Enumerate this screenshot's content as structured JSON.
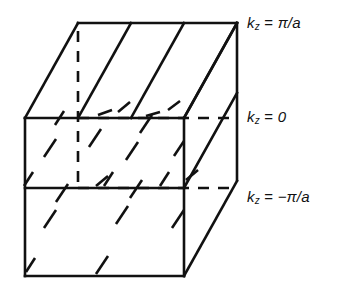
{
  "figure": {
    "stroke_color": "#111111",
    "background_color": "#ffffff"
  },
  "labels": {
    "top": {
      "symbol": "k",
      "subscript": "z",
      "operator": "=",
      "value": "π/a",
      "full": "k_z = π/a"
    },
    "middle": {
      "symbol": "k",
      "subscript": "z",
      "operator": "=",
      "value": "0",
      "full": "k_z = 0"
    },
    "bottom": {
      "symbol": "k",
      "subscript": "z",
      "operator": "=",
      "value": "−π/a",
      "full": "k_z = −π/a"
    }
  },
  "geometry": {
    "front_left_x": 25,
    "front_right_x": 184,
    "top_y": 118,
    "middle_y": 188,
    "bottom_y": 276,
    "depth_dx": 53,
    "depth_dy": -95,
    "planes": [
      {
        "name": "kz = pi/a",
        "y_at_right_edge": 23,
        "label_y": 30
      },
      {
        "name": "kz = 0",
        "y_at_right_edge": 118,
        "label_y": 113
      },
      {
        "name": "kz = -pi/a",
        "y_at_right_edge": 188,
        "label_y": 195
      }
    ]
  }
}
